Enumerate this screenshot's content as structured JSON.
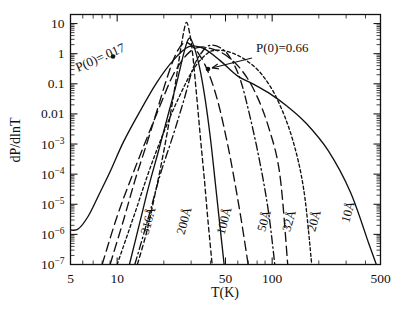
{
  "figure": {
    "background": "#ffffff",
    "ink": "#111111"
  },
  "axes": {
    "xlabel": "T(K)",
    "ylabel": "dP/dlnT",
    "xlim": [
      5,
      500
    ],
    "ylim": [
      1e-07,
      20
    ],
    "xscale": "log",
    "yscale": "log",
    "xticks": [
      {
        "value": 5,
        "label": "5"
      },
      {
        "value": 10,
        "label": "10"
      },
      {
        "value": 50,
        "label": "50"
      },
      {
        "value": 100,
        "label": "100"
      },
      {
        "value": 500,
        "label": "500"
      }
    ],
    "yticks": [
      {
        "value": 10,
        "mant": "10",
        "exp": ""
      },
      {
        "value": 1,
        "mant": "1",
        "exp": ""
      },
      {
        "value": 0.1,
        "mant": "0.1",
        "exp": ""
      },
      {
        "value": 0.01,
        "mant": "0.01",
        "exp": ""
      },
      {
        "value": 0.001,
        "mant": "10",
        "exp": "−3"
      },
      {
        "value": 0.0001,
        "mant": "10",
        "exp": "−4"
      },
      {
        "value": 1e-05,
        "mant": "10",
        "exp": "−5"
      },
      {
        "value": 1e-06,
        "mant": "10",
        "exp": "−6"
      },
      {
        "value": 1e-07,
        "mant": "10",
        "exp": "−7"
      }
    ],
    "grid": false,
    "ticks_inward": true
  },
  "annotations": [
    {
      "id": "p0-017",
      "text": "P(0)=.017",
      "rotation": -24,
      "text_x": 78,
      "text_y": 72,
      "dot_x": 113,
      "dot_y": 56.5,
      "has_arrow": false
    },
    {
      "id": "p0-066",
      "text": "P(0)=0.66",
      "rotation": 0,
      "text_x": 256,
      "text_y": 52,
      "dot_x": 208,
      "dot_y": 69,
      "has_arrow": true,
      "arrow_from_x": 252,
      "arrow_from_y": 58,
      "arrow_to_x": 212,
      "arrow_to_y": 68
    }
  ],
  "chart_data": {
    "type": "line",
    "title": "",
    "subtitle": "",
    "xlabel": "T(K)",
    "ylabel": "dP/dlnT",
    "xscale": "log",
    "yscale": "log",
    "xlim": [
      5,
      500
    ],
    "ylim": [
      1e-07,
      20
    ],
    "grid": false,
    "legend": "inline curve labels",
    "legend_position": "inline",
    "annotations": [
      "P(0)=.017",
      "P(0)=0.66"
    ],
    "series": [
      {
        "name": "316Å",
        "label": "316Å",
        "linestyle": "dashed",
        "label_x": 152,
        "label_y": 222,
        "peak_T": 28,
        "peak_value": 11,
        "x": [
          13.5,
          15.5,
          17.5,
          19.5,
          21.5,
          23.5,
          25.5,
          27.0,
          28.0,
          29.0,
          30.5,
          32.5,
          34.5,
          36.5,
          38.5,
          41.0
        ],
        "y": [
          1e-07,
          1.2e-06,
          2e-05,
          0.0003,
          0.0045,
          0.07,
          1.1,
          6.0,
          11.0,
          6.5,
          1.3,
          0.045,
          0.0015,
          7e-05,
          3e-06,
          1e-07
        ]
      },
      {
        "name": "200Å",
        "label": "200Å",
        "linestyle": "solid",
        "label_x": 188,
        "label_y": 222,
        "peak_T": 29,
        "peak_value": 3.2,
        "x": [
          12.0,
          14.0,
          16.0,
          18.5,
          21.0,
          24.0,
          27.0,
          29.0,
          31.0,
          34.0,
          37.0,
          40.0,
          43.0,
          46.0,
          49.0
        ],
        "y": [
          1e-07,
          2.5e-06,
          4e-05,
          0.0006,
          0.007,
          0.09,
          1.1,
          3.2,
          2.0,
          0.35,
          0.03,
          0.0015,
          5e-05,
          2e-06,
          1e-07
        ]
      },
      {
        "name": "100Å",
        "label": "100Å",
        "linestyle": "longdash",
        "label_x": 228,
        "label_y": 222,
        "peak_T": 27,
        "peak_value": 2.3,
        "x": [
          9.0,
          11.0,
          13.0,
          15.5,
          18.0,
          21.0,
          24.0,
          27.0,
          30.0,
          34.0,
          39.0,
          45.0,
          52.0,
          58.0,
          64.0,
          70.0
        ],
        "y": [
          1e-07,
          3e-06,
          6e-05,
          0.001,
          0.012,
          0.16,
          1.0,
          2.3,
          1.9,
          0.9,
          0.22,
          0.022,
          0.0008,
          4e-05,
          2e-06,
          1e-07
        ]
      },
      {
        "name": "50Å",
        "label": "50Å",
        "linestyle": "dashdot",
        "label_x": 268,
        "label_y": 222,
        "peak_T": 40,
        "peak_value": 1.9,
        "x": [
          13.0,
          16.0,
          19.0,
          23.0,
          27.0,
          31.0,
          36.0,
          40.0,
          46.0,
          53.0,
          62.0,
          72.0,
          84.0,
          95.0,
          104.0
        ],
        "y": [
          1e-07,
          4e-06,
          0.0001,
          0.002,
          0.03,
          0.35,
          1.3,
          1.9,
          1.6,
          0.8,
          0.15,
          0.008,
          0.0002,
          5e-06,
          1e-07
        ]
      },
      {
        "name": "32Å",
        "label": "32Å",
        "linestyle": "longdash",
        "label_x": 293,
        "label_y": 222,
        "peak_T": 33,
        "peak_value": 1.6,
        "x": [
          8.0,
          10.0,
          12.5,
          15.5,
          19.0,
          23.0,
          28.0,
          33.0,
          40.0,
          50.0,
          63.0,
          78.0,
          95.0,
          112.0,
          126.0
        ],
        "y": [
          1e-07,
          4e-06,
          9e-05,
          0.0015,
          0.02,
          0.2,
          0.9,
          1.6,
          1.5,
          0.9,
          0.3,
          0.05,
          0.0035,
          0.0001,
          1e-07
        ]
      },
      {
        "name": "20Å",
        "label": "20Å",
        "linestyle": "shortdash",
        "label_x": 318,
        "label_y": 222,
        "peak_T": 44,
        "peak_value": 1.3,
        "x": [
          10.0,
          13.0,
          16.0,
          20.0,
          25.0,
          31.0,
          38.0,
          44.0,
          54.0,
          68.0,
          86.0,
          108.0,
          135.0,
          160.0,
          180.0
        ],
        "y": [
          1e-07,
          5e-06,
          0.00012,
          0.0025,
          0.035,
          0.3,
          1.0,
          1.3,
          1.1,
          0.6,
          0.2,
          0.03,
          0.0015,
          3e-05,
          1e-07
        ]
      },
      {
        "name": "10Å",
        "label": "10Å",
        "linestyle": "solid",
        "label_x": 352,
        "label_y": 213,
        "peak_T": 29,
        "peak_value": 1.7,
        "x": [
          5.0,
          5.6,
          6.5,
          7.6,
          9.0,
          11.0,
          14.0,
          18.0,
          23.0,
          29.0,
          36.0,
          46.0,
          60.0,
          75.0,
          95.0,
          125.0,
          165.0,
          230.0,
          320.0,
          420.0,
          470.0
        ],
        "y": [
          1.4e-06,
          1.5e-06,
          4e-06,
          2e-05,
          0.00012,
          0.0012,
          0.012,
          0.11,
          0.6,
          1.7,
          1.5,
          0.6,
          0.18,
          0.1,
          0.05,
          0.018,
          0.005,
          0.0006,
          2.5e-05,
          5e-07,
          1e-07
        ]
      }
    ]
  }
}
